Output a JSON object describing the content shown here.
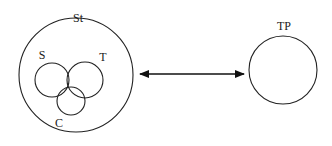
{
  "diagram": {
    "left_group": {
      "outer_label": "St",
      "inner_circles": [
        {
          "label": "S"
        },
        {
          "label": "T"
        },
        {
          "label": "C"
        }
      ]
    },
    "right_circle": {
      "label": "TP"
    },
    "connector": {
      "type": "bidirectional-arrow"
    }
  }
}
